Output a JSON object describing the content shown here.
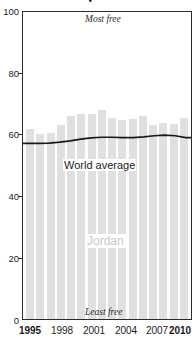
{
  "figure": {
    "title_partial": "y",
    "top_annotation": "Most free",
    "bottom_annotation": "Least free",
    "country_label": "Jordan",
    "series_label": "World average",
    "bar_color": "#e0e0e0",
    "line_color": "#1a1a1a",
    "axis_color": "#2b2b2b",
    "country_label_color": "#c9c9c9"
  },
  "chart_data": {
    "type": "bar",
    "title": "",
    "xlabel": "",
    "ylabel": "",
    "ylim": [
      0,
      100
    ],
    "yticks": [
      0,
      20,
      40,
      60,
      80,
      100
    ],
    "ytick_labels": [
      "0",
      "20",
      "40",
      "60",
      "80",
      "100"
    ],
    "grid": false,
    "legend": "inline-annotation",
    "categories": [
      1995,
      1996,
      1997,
      1998,
      1999,
      2000,
      2001,
      2002,
      2003,
      2004,
      2005,
      2006,
      2007,
      2008,
      2009,
      2010
    ],
    "xtick_labels": [
      "1995",
      "1998",
      "2001",
      "2004",
      "2007",
      "2010"
    ],
    "xtick_values": [
      1995,
      1998,
      2001,
      2004,
      2007,
      2010
    ],
    "xtick_bold": [
      "1995",
      "2010"
    ],
    "series": [
      {
        "name": "Jordan",
        "type": "bar",
        "values": [
          62.0,
          60.3,
          60.5,
          63.3,
          66.1,
          66.7,
          66.7,
          68.0,
          65.5,
          64.8,
          65.2,
          66.0,
          63.2,
          63.7,
          63.5,
          65.4
        ]
      },
      {
        "name": "World average",
        "type": "line",
        "values": [
          57.2,
          57.2,
          57.3,
          57.6,
          58.0,
          58.6,
          59.0,
          59.2,
          59.2,
          59.1,
          59.1,
          59.3,
          59.7,
          59.9,
          59.7,
          59.1
        ]
      }
    ],
    "annotations": [
      {
        "text": "Most free",
        "position": "top-inside"
      },
      {
        "text": "Least free",
        "position": "bottom-inside"
      },
      {
        "text": "Jordan",
        "position": "center-inside"
      },
      {
        "text": "World average",
        "position": "near-line"
      }
    ]
  }
}
